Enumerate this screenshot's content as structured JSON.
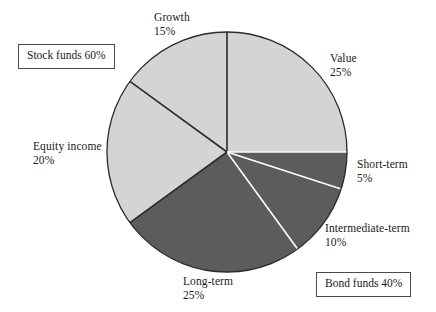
{
  "chart_data": {
    "type": "pie",
    "title": "",
    "center": {
      "x": 227,
      "y": 152
    },
    "radius": 120,
    "start_angle_deg": 0,
    "direction": "clockwise",
    "legend": "labels-outside-with-leader-lines",
    "categories": [
      "Value",
      "Short-term",
      "Intermediate-term",
      "Long-term",
      "Equity income",
      "Growth"
    ],
    "values": [
      25,
      5,
      10,
      25,
      20,
      15
    ],
    "unit": "%",
    "slices": [
      {
        "name": "Value",
        "label": "Value",
        "percent": 25,
        "percent_text": "25%",
        "group": "Stock funds",
        "color": "#d4d4d4",
        "edge": "#2b2b2b",
        "start_deg": 0,
        "end_deg": 90
      },
      {
        "name": "Short-term",
        "label": "Short-term",
        "percent": 5,
        "percent_text": "5%",
        "group": "Bond funds",
        "color": "#5c5c5c",
        "edge": "#ffffff",
        "start_deg": 90,
        "end_deg": 108
      },
      {
        "name": "Intermediate-term",
        "label": "Intermediate-term",
        "percent": 10,
        "percent_text": "10%",
        "group": "Bond funds",
        "color": "#5c5c5c",
        "edge": "#ffffff",
        "start_deg": 108,
        "end_deg": 144
      },
      {
        "name": "Long-term",
        "label": "Long-term",
        "percent": 25,
        "percent_text": "25%",
        "group": "Bond funds",
        "color": "#5c5c5c",
        "edge": "#ffffff",
        "start_deg": 144,
        "end_deg": 234
      },
      {
        "name": "Equity income",
        "label": "Equity income",
        "percent": 20,
        "percent_text": "20%",
        "group": "Stock funds",
        "color": "#d4d4d4",
        "edge": "#2b2b2b",
        "start_deg": 234,
        "end_deg": 306
      },
      {
        "name": "Growth",
        "label": "Growth",
        "percent": 15,
        "percent_text": "15%",
        "group": "Stock funds",
        "color": "#d4d4d4",
        "edge": "#2b2b2b",
        "start_deg": 306,
        "end_deg": 360
      }
    ],
    "groups": [
      {
        "name": "Stock funds",
        "label": "Stock funds 60%",
        "percent": 60,
        "color": "#d4d4d4",
        "members": [
          "Growth",
          "Value",
          "Equity income"
        ]
      },
      {
        "name": "Bond funds",
        "label": "Bond funds 40%",
        "percent": 40,
        "color": "#5c5c5c",
        "members": [
          "Short-term",
          "Intermediate-term",
          "Long-term"
        ]
      }
    ]
  },
  "labels": {
    "growth": {
      "name": "Growth",
      "percent": "15%"
    },
    "value": {
      "name": "Value",
      "percent": "25%"
    },
    "equity_income": {
      "name": "Equity income",
      "percent": "20%"
    },
    "short_term": {
      "name": "Short-term",
      "percent": "5%"
    },
    "intermediate_term": {
      "name": "Intermediate-term",
      "percent": "10%"
    },
    "long_term": {
      "name": "Long-term",
      "percent": "25%"
    }
  },
  "boxes": {
    "stock_funds": "Stock funds 60%",
    "bond_funds": "Bond funds 40%"
  },
  "colors": {
    "stock_fill": "#d4d4d4",
    "bond_fill": "#5c5c5c",
    "stock_edge": "#2b2b2b",
    "bond_edge": "#ffffff",
    "outline": "#2b2b2b",
    "leader": "#2b2b2b",
    "background": "#ffffff",
    "text": "#1a1a1a"
  },
  "leader_lines": [
    {
      "name": "stock-funds-leader",
      "from_deg": 234,
      "to": {
        "x": 78,
        "y": 265
      }
    },
    {
      "name": "bond-funds-leader",
      "from_deg": 90,
      "to": {
        "x": 420,
        "y": 152
      }
    }
  ]
}
